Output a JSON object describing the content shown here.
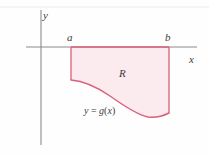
{
  "figure": {
    "type": "math-diagram",
    "background_color": "#fefefe",
    "axis_color": "#8a8a8a",
    "curve_color": "#d9607a",
    "fill_color": "#fbeaee",
    "label_color": "#3b3b3b",
    "labels": {
      "y_axis": "y",
      "x_axis": "x",
      "left_bound": "a",
      "right_bound": "b",
      "region": "R",
      "function_prefix": "y",
      "function_equals": " = ",
      "function_name": "g",
      "function_open": "(",
      "function_var": "x",
      "function_close": ")",
      "function_full": "y = g(x)"
    },
    "geometry": {
      "x_axis_y": 47,
      "y_axis_x": 41,
      "a_x": 71,
      "b_x": 169,
      "left_edge_bottom_y": 80,
      "right_edge_bottom_y": 113,
      "curve_min_y": 117
    }
  }
}
